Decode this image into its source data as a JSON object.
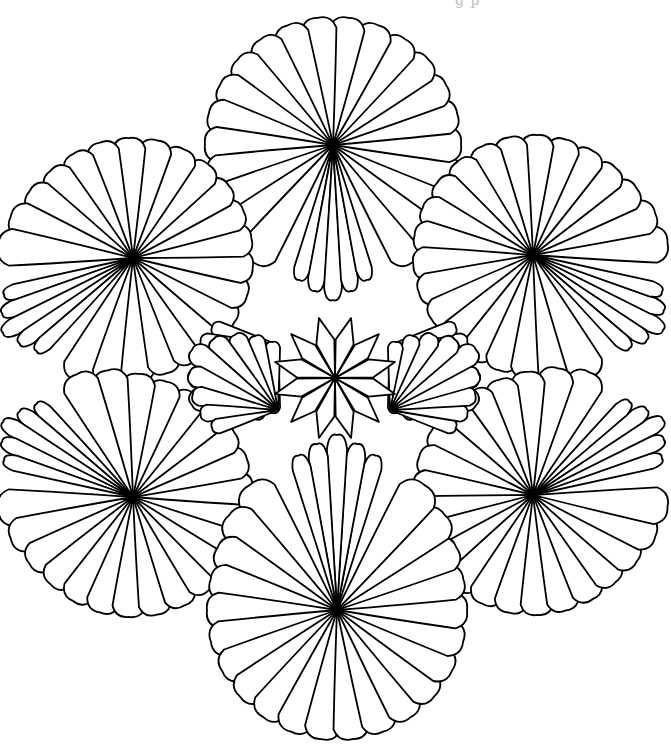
{
  "page": {
    "caption_fragment": "g p",
    "background": "#ffffff",
    "line_color": "#000000"
  },
  "artwork": {
    "big_fans": [
      {
        "name": "top",
        "cx": 333,
        "cy": 145,
        "dir": 90,
        "r": 128,
        "tail": 155,
        "count": 22
      },
      {
        "name": "upper-left",
        "cx": 133,
        "cy": 258,
        "dir": 30,
        "r": 120,
        "tail": 150,
        "count": 22
      },
      {
        "name": "upper-right",
        "cx": 533,
        "cy": 255,
        "dir": 150,
        "r": 120,
        "tail": 150,
        "count": 22
      },
      {
        "name": "lower-left",
        "cx": 133,
        "cy": 497,
        "dir": -30,
        "r": 120,
        "tail": 150,
        "count": 22
      },
      {
        "name": "lower-right",
        "cx": 533,
        "cy": 495,
        "dir": -150,
        "r": 120,
        "tail": 150,
        "count": 22
      },
      {
        "name": "bottom",
        "cx": 337,
        "cy": 610,
        "dir": -90,
        "r": 130,
        "tail": 175,
        "count": 22
      }
    ],
    "inner_fans": [
      {
        "name": "inner-upper-left",
        "cx": 278,
        "cy": 345,
        "dir": -145,
        "r": 105,
        "count": 9
      },
      {
        "name": "inner-upper-right",
        "cx": 390,
        "cy": 345,
        "dir": -35,
        "r": 105,
        "count": 9
      },
      {
        "name": "inner-lower-left",
        "cx": 278,
        "cy": 410,
        "dir": 145,
        "r": 105,
        "count": 9
      },
      {
        "name": "inner-lower-right",
        "cx": 390,
        "cy": 410,
        "dir": 35,
        "r": 105,
        "count": 9
      }
    ],
    "center_flower": {
      "cx": 335,
      "cy": 378,
      "petals": 12,
      "r": 62
    }
  }
}
